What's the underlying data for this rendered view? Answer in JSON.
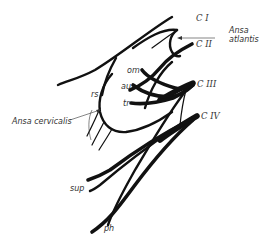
{
  "diagram": {
    "labels": {
      "c1": "C I",
      "c2": "C II",
      "c3": "C III",
      "c4": "C IV",
      "ansa_atlantis_line1": "Ansa",
      "ansa_atlantis_line2": "atlantis",
      "ansa_cervicalis": "Ansa cervicalis",
      "rs": "rs",
      "om": "om",
      "au": "au",
      "tr": "tr",
      "sup": "sup",
      "ph": "ph"
    },
    "colors": {
      "line": "#111111",
      "text": "#333333",
      "background": "#ffffff"
    }
  }
}
